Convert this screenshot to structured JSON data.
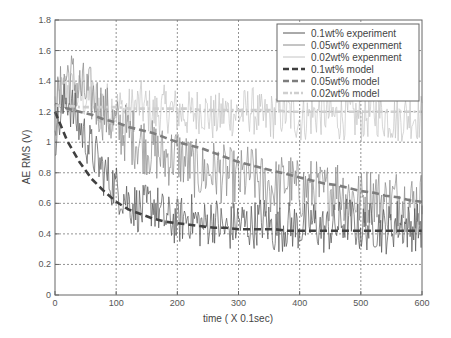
{
  "chart_data": {
    "type": "line",
    "title": "",
    "xlabel": "time ( X 0.1sec)",
    "ylabel": "AE RMS (V)",
    "xlim": [
      0,
      600
    ],
    "ylim": [
      0,
      1.8
    ],
    "x_ticks": [
      "0",
      "100",
      "200",
      "300",
      "400",
      "500",
      "600"
    ],
    "y_ticks": [
      "0",
      "0.2",
      "0.4",
      "0.6",
      "0.8",
      "1",
      "1.2",
      "1.4",
      "1.6",
      "1.8"
    ],
    "grid": true,
    "legend_position": "upper right",
    "x": [
      0,
      20,
      40,
      60,
      80,
      100,
      120,
      140,
      160,
      180,
      200,
      220,
      240,
      260,
      280,
      300,
      320,
      340,
      360,
      380,
      400,
      420,
      440,
      460,
      480,
      500,
      520,
      540,
      560,
      580,
      600
    ],
    "series": [
      {
        "name": "0.1wt% experiment",
        "style": "thin-solid",
        "color": "#555555",
        "values": [
          1.05,
          1.3,
          1.1,
          0.95,
          0.8,
          0.7,
          0.62,
          0.55,
          0.6,
          0.5,
          0.48,
          0.52,
          0.45,
          0.5,
          0.42,
          0.48,
          0.45,
          0.5,
          0.42,
          0.46,
          0.44,
          0.48,
          0.42,
          0.45,
          0.5,
          0.43,
          0.46,
          0.42,
          0.48,
          0.44,
          0.45
        ]
      },
      {
        "name": "0.05wt% experiment",
        "style": "thin-solid",
        "color": "#8a8a8a",
        "values": [
          1.2,
          1.45,
          1.35,
          1.3,
          1.2,
          1.1,
          1.05,
          1.0,
          0.95,
          0.9,
          0.92,
          0.85,
          0.8,
          0.82,
          0.78,
          0.75,
          0.8,
          0.72,
          0.7,
          0.75,
          0.68,
          0.7,
          0.66,
          0.72,
          0.65,
          0.62,
          0.66,
          0.6,
          0.64,
          0.6,
          0.62
        ]
      },
      {
        "name": "0.02wt% experiment",
        "style": "thin-solid",
        "color": "#c4c4c4",
        "values": [
          1.25,
          1.35,
          1.3,
          1.28,
          1.25,
          1.22,
          1.2,
          1.25,
          1.18,
          1.22,
          1.2,
          1.18,
          1.22,
          1.15,
          1.2,
          1.18,
          1.22,
          1.15,
          1.18,
          1.2,
          1.15,
          1.18,
          1.2,
          1.16,
          1.18,
          1.15,
          1.2,
          1.17,
          1.15,
          1.18,
          1.16
        ]
      },
      {
        "name": "0.1wt% model",
        "style": "thick-dashed",
        "color": "#404040",
        "values": [
          1.2,
          1.01,
          0.87,
          0.76,
          0.68,
          0.61,
          0.56,
          0.53,
          0.5,
          0.48,
          0.47,
          0.46,
          0.45,
          0.44,
          0.44,
          0.43,
          0.43,
          0.43,
          0.43,
          0.42,
          0.42,
          0.42,
          0.42,
          0.42,
          0.42,
          0.42,
          0.42,
          0.42,
          0.42,
          0.42,
          0.42
        ]
      },
      {
        "name": "0.05wt% model",
        "style": "thick-dashed",
        "color": "#7d7d7d",
        "values": [
          1.25,
          1.22,
          1.2,
          1.18,
          1.15,
          1.13,
          1.1,
          1.08,
          1.06,
          1.03,
          1.0,
          0.98,
          0.96,
          0.93,
          0.9,
          0.87,
          0.85,
          0.83,
          0.81,
          0.79,
          0.77,
          0.75,
          0.73,
          0.72,
          0.7,
          0.68,
          0.67,
          0.65,
          0.64,
          0.62,
          0.61
        ]
      },
      {
        "name": "0.02wt% model",
        "style": "thick-dash-dot",
        "color": "#cfcfcf",
        "values": [
          1.24,
          1.24,
          1.23,
          1.23,
          1.23,
          1.23,
          1.22,
          1.22,
          1.22,
          1.22,
          1.22,
          1.22,
          1.21,
          1.21,
          1.21,
          1.21,
          1.21,
          1.21,
          1.21,
          1.2,
          1.2,
          1.2,
          1.2,
          1.2,
          1.2,
          1.2,
          1.2,
          1.2,
          1.2,
          1.2,
          1.2
        ]
      }
    ]
  },
  "legend": {
    "items": [
      {
        "label": "0.1wt% experiment"
      },
      {
        "label": "0.05wt% expenment"
      },
      {
        "label": "0.02wt% expenment"
      },
      {
        "label": "0.1wt% model"
      },
      {
        "label": "0.05wt% model"
      },
      {
        "label": "0.02wt% model"
      }
    ]
  }
}
